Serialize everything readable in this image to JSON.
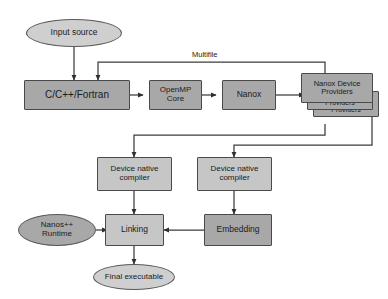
{
  "diagram": {
    "colors": {
      "box_dark": "#a8a8a8",
      "box_light": "#c6c6c6",
      "ellipse_dark": "#a8a8a8",
      "ellipse_light": "#cfcfcf",
      "stroke": "#4a4a4a",
      "line": "#3c3c3c",
      "background": "#ffffff",
      "text": "#1b1b1b"
    },
    "nodes": {
      "input_source": "Input source",
      "source_languages": "C/C++/Fortran",
      "openmp_core": "OpenMP\nCore",
      "openmp_core_line1": "OpenMP",
      "openmp_core_line2": "Core",
      "nanox": "Nanox",
      "nanox_device_providers": "Nanox Device\nProviders",
      "nanox_device_providers_line1": "Nanox Device",
      "nanox_device_providers_line2": "Providers",
      "providers_stack_mid": "Providers",
      "providers_stack_back": "Providers",
      "device_native_compiler_left_line1": "Device native",
      "device_native_compiler_left_line2": "compiler",
      "device_native_compiler_right_line1": "Device native",
      "device_native_compiler_right_line2": "compiler",
      "nanos_runtime_line1": "Nanos++",
      "nanos_runtime_line2": "Runtime",
      "linking": "Linking",
      "embedding": "Embedding",
      "final_executable": "Final executable"
    },
    "edge_labels": {
      "multifile": "Multifile"
    }
  }
}
